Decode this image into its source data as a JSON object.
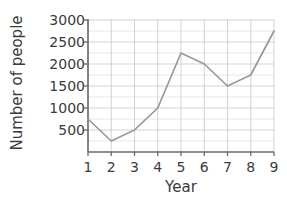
{
  "chart_data": {
    "type": "line",
    "title": "",
    "xlabel": "Year",
    "ylabel": "Number of people",
    "x": [
      1,
      2,
      3,
      4,
      5,
      6,
      7,
      8,
      9
    ],
    "values": [
      750,
      250,
      500,
      1000,
      2250,
      2000,
      1500,
      1750,
      2750
    ],
    "series": [
      {
        "name": "Number of people",
        "values": [
          750,
          250,
          500,
          1000,
          2250,
          2000,
          1500,
          1750,
          2750
        ]
      }
    ],
    "xlim": [
      1,
      9
    ],
    "ylim": [
      0,
      3000
    ],
    "x_tick_labels": [
      "1",
      "2",
      "3",
      "4",
      "5",
      "6",
      "7",
      "8",
      "9"
    ],
    "y_tick_labels": [
      "500",
      "1000",
      "1500",
      "2000",
      "2500",
      "3000"
    ],
    "y_tick_values": [
      500,
      1000,
      1500,
      2000,
      2500,
      3000
    ],
    "y_minor_step": 250,
    "grid": true,
    "legend": false,
    "line_color": "#999999",
    "grid_color": "#c8c8c8",
    "axis_color": "#6a6a6a",
    "text_color": "#3b3b3b"
  }
}
